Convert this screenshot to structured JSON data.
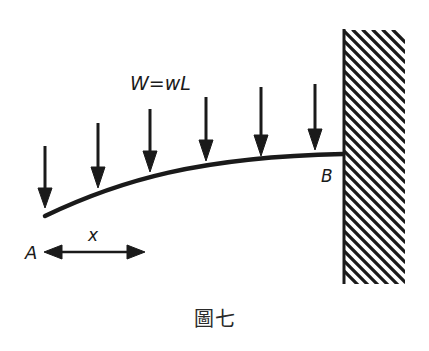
{
  "diagram": {
    "load_label": "W=wL",
    "point_a_label": "A",
    "point_b_label": "B",
    "distance_label": "x",
    "caption": "圖七",
    "load_arrow_count": 6,
    "colors": {
      "ink": "#1a1a1a",
      "background": "#ffffff"
    }
  }
}
